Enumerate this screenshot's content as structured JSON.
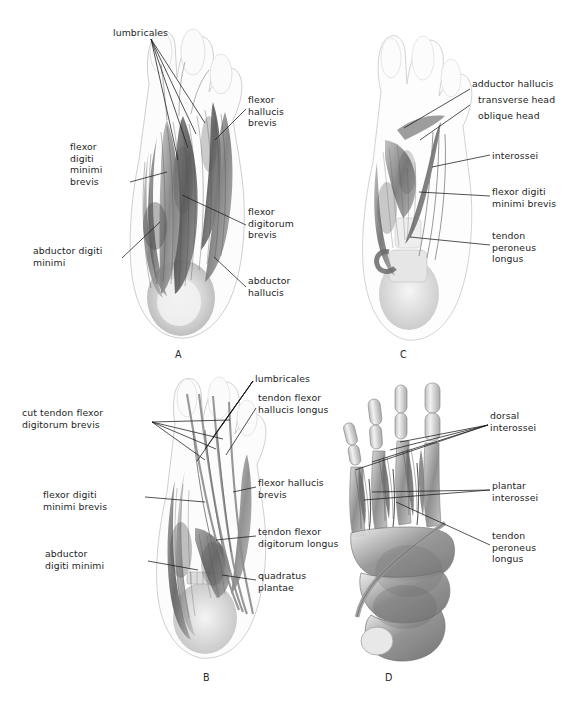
{
  "figure": {
    "background_color": "#ffffff",
    "ink_color": "#1a1a1a"
  },
  "panels": [
    {
      "id": "A",
      "letter": "A",
      "letter_pos": [
        175,
        349
      ],
      "view": "plantar-superficial-layer",
      "labels": [
        {
          "name": "lumbricales",
          "text": "lumbricales",
          "x": 113,
          "y": 27,
          "align": "left"
        },
        {
          "name": "flexor-hallucis-brevis",
          "text": "flexor\nhallucis\nbrevis",
          "x": 248,
          "y": 94,
          "align": "left"
        },
        {
          "name": "flexor-digiti-minimi-brevis",
          "text": "flexor\ndigiti\nminimi\nbrevis",
          "x": 70,
          "y": 141,
          "align": "left"
        },
        {
          "name": "flexor-digitorum-brevis",
          "text": "flexor\ndigitorum\nbrevis",
          "x": 248,
          "y": 206,
          "align": "left"
        },
        {
          "name": "abductor-digiti-minimi",
          "text": "abductor digiti\nminimi",
          "x": 33,
          "y": 245,
          "align": "left"
        },
        {
          "name": "abductor-hallucis",
          "text": "abductor\nhallucis",
          "x": 248,
          "y": 275,
          "align": "left"
        }
      ]
    },
    {
      "id": "C",
      "letter": "C",
      "letter_pos": [
        400,
        349
      ],
      "view": "plantar-deep-layer",
      "labels": [
        {
          "name": "adductor-hallucis",
          "text": "adductor hallucis",
          "x": 472,
          "y": 78,
          "align": "left"
        },
        {
          "name": "transverse-head",
          "text": "transverse head",
          "x": 478,
          "y": 94,
          "align": "left"
        },
        {
          "name": "oblique-head",
          "text": "oblique head",
          "x": 478,
          "y": 110,
          "align": "left"
        },
        {
          "name": "interossei",
          "text": "interossei",
          "x": 492,
          "y": 150,
          "align": "left"
        },
        {
          "name": "flexor-digiti-minimi-brevis",
          "text": "flexor digiti\nminimi brevis",
          "x": 492,
          "y": 186,
          "align": "left"
        },
        {
          "name": "tendon-peroneus-longus",
          "text": "tendon\nperoneus\nlongus",
          "x": 492,
          "y": 230,
          "align": "left"
        }
      ]
    },
    {
      "id": "B",
      "letter": "B",
      "letter_pos": [
        203,
        672
      ],
      "view": "plantar-second-layer",
      "labels": [
        {
          "name": "lumbricales",
          "text": "lumbricales",
          "x": 255,
          "y": 373,
          "align": "left"
        },
        {
          "name": "tendon-flexor-hallucis-longus",
          "text": "tendon flexor\nhallucis longus",
          "x": 258,
          "y": 392,
          "align": "left"
        },
        {
          "name": "cut-tendon-flexor-digitorum-brevis",
          "text": "cut tendon flexor\ndigitorum brevis",
          "x": 22,
          "y": 407,
          "align": "left"
        },
        {
          "name": "flexor-hallucis-brevis",
          "text": "flexor hallucis\nbrevis",
          "x": 258,
          "y": 477,
          "align": "left"
        },
        {
          "name": "flexor-digiti-minimi-brevis",
          "text": "flexor digiti\nminimi brevis",
          "x": 43,
          "y": 489,
          "align": "left"
        },
        {
          "name": "tendon-flexor-digitorum-longus",
          "text": "tendon flexor\ndigitorum longus",
          "x": 258,
          "y": 526,
          "align": "left"
        },
        {
          "name": "abductor-digiti-minimi",
          "text": "abductor\ndigiti minimi",
          "x": 45,
          "y": 548,
          "align": "left"
        },
        {
          "name": "quadratus-plantae",
          "text": "quadratus\nplantae",
          "x": 258,
          "y": 570,
          "align": "left"
        }
      ]
    },
    {
      "id": "D",
      "letter": "D",
      "letter_pos": [
        385,
        672
      ],
      "view": "plantar-skeletal-interossei",
      "labels": [
        {
          "name": "dorsal-interossei",
          "text": "dorsal\ninterossei",
          "x": 490,
          "y": 410,
          "align": "left"
        },
        {
          "name": "plantar-interossei",
          "text": "plantar\ninterossei",
          "x": 492,
          "y": 480,
          "align": "left"
        },
        {
          "name": "tendon-peroneus-longus",
          "text": "tendon\nperoneus\nlongus",
          "x": 492,
          "y": 530,
          "align": "left"
        }
      ]
    }
  ],
  "leader_lines": {
    "count": 28,
    "stroke": "#1a1a1a",
    "width": 0.75
  }
}
